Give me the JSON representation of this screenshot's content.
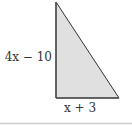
{
  "diagram": {
    "shape": "right-triangle",
    "fill_color": "#e0e0e0",
    "stroke_color": "#333333",
    "labels": {
      "vertical_side": "4x − 10",
      "horizontal_side": "x + 3"
    },
    "rule_color": "#cccccc"
  }
}
